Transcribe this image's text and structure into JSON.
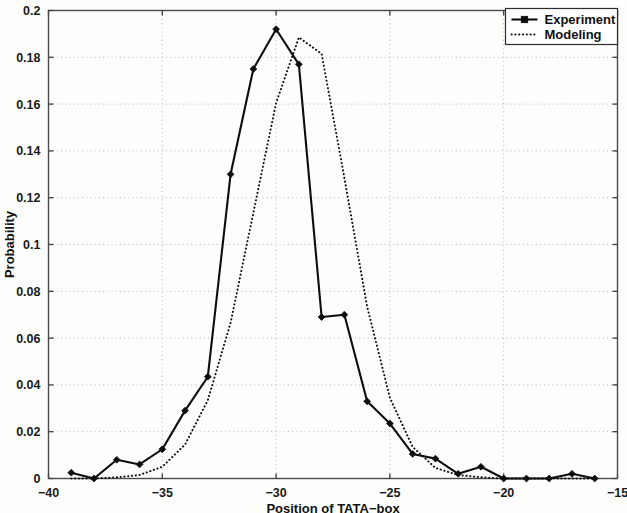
{
  "chart_data": {
    "type": "line",
    "title": "",
    "subtitle": "",
    "xlabel": "Position of TATA-box",
    "ylabel": "Probability",
    "xlim": [
      -40,
      -15
    ],
    "ylim": [
      0,
      0.2
    ],
    "xticks": [
      -40,
      -35,
      -30,
      -25,
      -20,
      -15
    ],
    "xticklabels": [
      "-40",
      "-35",
      "-30",
      "-25",
      "-20",
      "-15"
    ],
    "yticks": [
      0,
      0.02,
      0.04,
      0.06,
      0.08,
      0.1,
      0.12,
      0.14,
      0.16,
      0.18,
      0.2
    ],
    "yticklabels": [
      "0",
      "0.02",
      "0.04",
      "0.06",
      "0.08",
      "0.1",
      "0.12",
      "0.14",
      "0.16",
      "0.18",
      "0.2"
    ],
    "grid": true,
    "grid_style": "dotted",
    "legend_position": "top-right",
    "series": [
      {
        "name": "Experiment",
        "style": "solid-with-markers",
        "marker": "diamond",
        "color": "#0d0d0d",
        "x": [
          -39,
          -38,
          -37,
          -36,
          -35,
          -34,
          -33,
          -32,
          -31,
          -30,
          -29,
          -28,
          -27,
          -26,
          -25,
          -24,
          -23,
          -22,
          -21,
          -20,
          -19,
          -18,
          -17,
          -16
        ],
        "y": [
          0.0025,
          0.0,
          0.008,
          0.006,
          0.0125,
          0.029,
          0.0435,
          0.13,
          0.175,
          0.192,
          0.177,
          0.069,
          0.07,
          0.033,
          0.0235,
          0.0105,
          0.0085,
          0.002,
          0.005,
          0.0,
          0.0,
          0.0,
          0.002,
          0.0
        ]
      },
      {
        "name": "Modeling",
        "style": "dotted",
        "color": "#111111",
        "x": [
          -39,
          -38,
          -37,
          -36,
          -35,
          -34,
          -33,
          -32,
          -31,
          -30,
          -29,
          -28,
          -27,
          -26,
          -25,
          -24,
          -23,
          -22,
          -21,
          -20,
          -19,
          -18,
          -17,
          -16
        ],
        "y": [
          0.0,
          0.0,
          0.0005,
          0.0015,
          0.005,
          0.0145,
          0.0335,
          0.0665,
          0.1135,
          0.1605,
          0.1885,
          0.1815,
          0.1285,
          0.0735,
          0.0345,
          0.0135,
          0.0045,
          0.0015,
          0.0005,
          0.0,
          0.0,
          0.0,
          0.0,
          0.0
        ]
      }
    ]
  },
  "legend": {
    "entries": [
      {
        "label": "Experiment",
        "marker": "solid-line-with-square-marker"
      },
      {
        "label": "Modeling",
        "marker": "dotted-line"
      }
    ]
  },
  "axes": {
    "x_title": "Position of TATA-box",
    "y_title": "Probability"
  }
}
